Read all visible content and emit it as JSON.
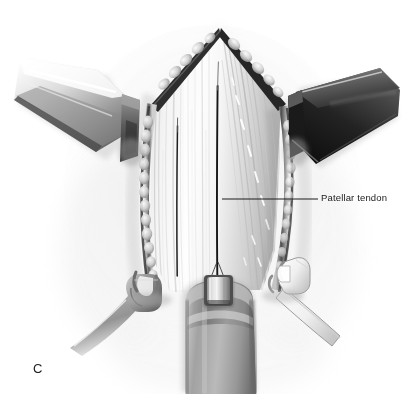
{
  "figure": {
    "letter": "C",
    "style": "grayscale-medical-illustration",
    "width": 409,
    "height": 394,
    "background_color": "#ffffff"
  },
  "annotations": [
    {
      "id": "patellar-tendon",
      "label": "Patellar tendon",
      "text_color": "#1b1b1b",
      "leader_line": {
        "x1": 222,
        "y1": 199,
        "x2": 318,
        "y2": 199,
        "color": "#1d1d1d"
      }
    }
  ],
  "anatomy": {
    "incision": {
      "name": "midline-longitudinal-incision",
      "apex_point": {
        "x": 220,
        "y": 29
      }
    },
    "tissues": [
      {
        "name": "patellar-tendon",
        "tone": "#f2f2f2"
      },
      {
        "name": "wound-edge-left",
        "tone": "#4a4a4a"
      },
      {
        "name": "wound-edge-right",
        "tone": "#3f3f3f"
      },
      {
        "name": "subcutaneous-fat-lobules",
        "tone": "#d6d6d6"
      },
      {
        "name": "tibial-tubercle-bone",
        "tone": "#9a9a9a"
      }
    ]
  },
  "instruments": [
    {
      "name": "retractor-blade-left",
      "type": "hohmann-retractor",
      "tone_light": "#f0f0f0",
      "tone_dark": "#3c3c3c"
    },
    {
      "name": "retractor-blade-right",
      "type": "hohmann-retractor",
      "tone_light": "#8d8d8d",
      "tone_dark": "#1c1c1c"
    },
    {
      "name": "retractor-hook-left",
      "type": "two-prong-rake-retractor",
      "tone_light": "#bcbcbc",
      "tone_dark": "#6e6e6e"
    },
    {
      "name": "retractor-hook-right",
      "type": "two-prong-rake-retractor",
      "tone_light": "#fcfcfc",
      "tone_dark": "#8a8a8a"
    },
    {
      "name": "surgical-staple",
      "type": "metal-staple",
      "tone_light": "#ededed",
      "tone_dark": "#707070"
    }
  ]
}
